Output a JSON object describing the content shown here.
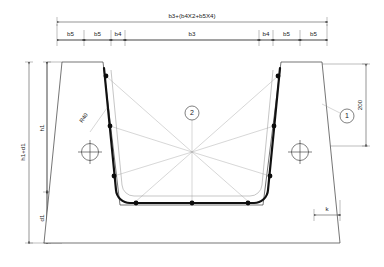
{
  "drawing": {
    "title": "Reinforced concrete trough cross-section",
    "colors": {
      "rebar": "#0c0c0c",
      "outline": "#3a3a3a",
      "dimension": "#2b2b2b",
      "leader": "#9a9a9a",
      "background": "#ffffff"
    }
  },
  "top_dimension": {
    "overall_label": "b3+(b4X2+b5X4)",
    "segments": [
      {
        "label": "b5"
      },
      {
        "label": "b5"
      },
      {
        "label": "b4"
      },
      {
        "label": "b3"
      },
      {
        "label": "b4"
      },
      {
        "label": "b5"
      },
      {
        "label": "b5"
      }
    ]
  },
  "left_dimensions": {
    "outer_label": "h1+d1",
    "upper_label": "h1",
    "lower_label": "d1"
  },
  "right_dimensions": {
    "label": "200"
  },
  "bottom_dimensions": {
    "label": "k"
  },
  "radius_note": {
    "label": "R40"
  },
  "callouts": [
    {
      "name": "callout-2",
      "label": "2"
    },
    {
      "name": "callout-1",
      "label": "1"
    }
  ],
  "section_markers": [
    {
      "name": "section-marker-left"
    },
    {
      "name": "section-marker-right"
    }
  ]
}
